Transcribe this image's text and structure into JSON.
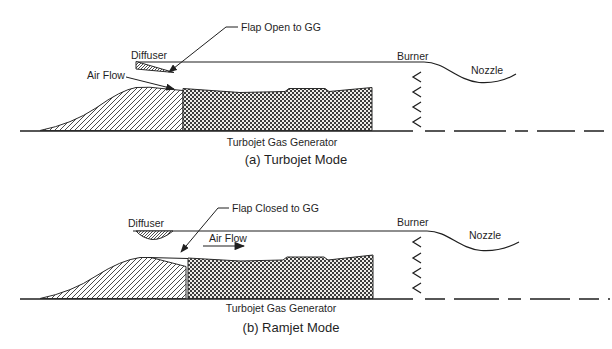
{
  "figure": {
    "background_color": "#ffffff",
    "line_color": "#1f1f1f"
  },
  "diagram_a": {
    "caption": "(a) Turbojet Mode",
    "labels": {
      "flap": "Flap Open to GG",
      "diffuser": "Diffuser",
      "air_flow": "Air Flow",
      "burner": "Burner",
      "nozzle": "Nozzle",
      "gas_generator": "Turbojet Gas Generator"
    }
  },
  "diagram_b": {
    "caption": "(b) Ramjet Mode",
    "labels": {
      "flap": "Flap Closed to GG",
      "diffuser": "Diffuser",
      "air_flow": "Air Flow",
      "burner": "Burner",
      "nozzle": "Nozzle",
      "gas_generator": "Turbojet Gas Generator"
    }
  },
  "icons": {
    "flame_holder_chevron": "<",
    "leader_arrowhead": "➤"
  }
}
